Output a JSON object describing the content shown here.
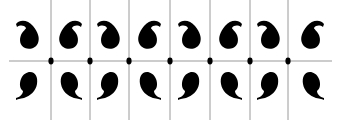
{
  "figure": {
    "description": "Decorative repeating pattern of paisley / comma-shaped motifs arranged in a 2-row by 8-column grid, separated by thin grey guide lines with black dots at the intersections",
    "background_color": "#ffffff",
    "motif_color": "#000000",
    "line_color": "#9a9a9a",
    "dot_color": "#000000",
    "width": 338,
    "height": 120
  },
  "grid": {
    "rows": 2,
    "columns": 8,
    "horizontal_line": {
      "y": 61,
      "x_start": 9,
      "x_end": 332
    },
    "vertical_lines_x": [
      51,
      90,
      129,
      170,
      210,
      250,
      288
    ],
    "vertical_line_y_start": 0,
    "vertical_line_y_end": 120,
    "intersection_dot_radius": 2.6
  },
  "motifs": {
    "column_centers_x": [
      28,
      70,
      109,
      149,
      190,
      230,
      269,
      312
    ],
    "top_row_center_y": 34,
    "bottom_row_center_y": 86,
    "top_row": [
      {
        "col": 1,
        "shape": "paisley-tail-left"
      },
      {
        "col": 2,
        "shape": "paisley-tail-right"
      },
      {
        "col": 3,
        "shape": "paisley-tail-left"
      },
      {
        "col": 4,
        "shape": "paisley-tail-right"
      },
      {
        "col": 5,
        "shape": "paisley-tail-left"
      },
      {
        "col": 6,
        "shape": "paisley-tail-right"
      },
      {
        "col": 7,
        "shape": "paisley-tail-left"
      },
      {
        "col": 8,
        "shape": "paisley-tail-right"
      }
    ],
    "bottom_row": [
      {
        "col": 1,
        "shape": "comma-tail-down-left"
      },
      {
        "col": 2,
        "shape": "comma-tail-down-right"
      },
      {
        "col": 3,
        "shape": "comma-tail-down-left"
      },
      {
        "col": 4,
        "shape": "comma-tail-down-right"
      },
      {
        "col": 5,
        "shape": "comma-tail-down-left"
      },
      {
        "col": 6,
        "shape": "comma-tail-down-right"
      },
      {
        "col": 7,
        "shape": "comma-tail-down-left"
      },
      {
        "col": 8,
        "shape": "comma-tail-down-right"
      }
    ]
  }
}
